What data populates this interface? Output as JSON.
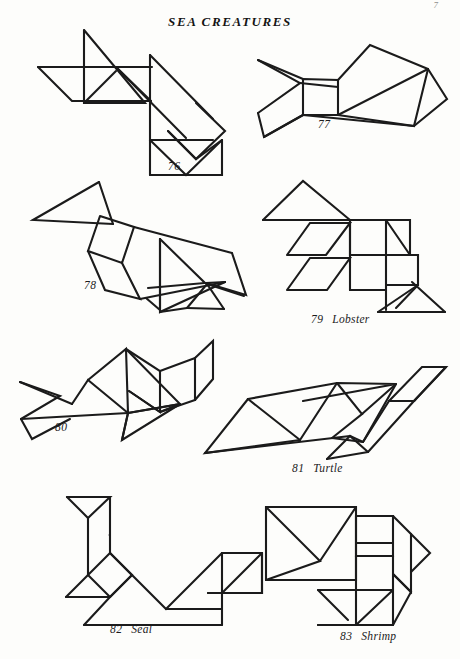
{
  "page": {
    "title": "SEA CREATURES",
    "corner_mark": "7",
    "background_color": "#fdfdfb",
    "ink_color": "#1b1b1b",
    "width": 460,
    "height": 659
  },
  "figures": [
    {
      "number": "76",
      "name": "",
      "caption_x": 168,
      "caption_y": 160,
      "description": "tangram sea creature 76"
    },
    {
      "number": "77",
      "name": "",
      "caption_x": 318,
      "caption_y": 118,
      "description": "tangram fish 77"
    },
    {
      "number": "78",
      "name": "",
      "caption_x": 84,
      "caption_y": 279,
      "description": "tangram sea creature 78"
    },
    {
      "number": "79",
      "name": "Lobster",
      "caption_x": 311,
      "caption_y": 313,
      "description": "tangram lobster"
    },
    {
      "number": "80",
      "name": "",
      "caption_x": 55,
      "caption_y": 421,
      "description": "tangram sea creature 80"
    },
    {
      "number": "81",
      "name": "Turtle",
      "caption_x": 292,
      "caption_y": 462,
      "description": "tangram turtle"
    },
    {
      "number": "82",
      "name": "Seal",
      "caption_x": 110,
      "caption_y": 623,
      "description": "tangram seal"
    },
    {
      "number": "83",
      "name": "Shrimp",
      "caption_x": 340,
      "caption_y": 630,
      "description": "tangram shrimp"
    }
  ],
  "shapes": {
    "fig76": [
      "84,30 84,103 145,103",
      "84,103 145,103 114,72",
      "38,68 152,68",
      "38,68 74,103 152,103 114,68",
      "152,68 152,103",
      "145,103 152,103",
      "38,68 38,68",
      "147,50 147,148 218,148 147,50",
      "147,148 218,148 230,122",
      "185,122 218,86 230,122 196,148",
      "124,148 196,148 160,113",
      "124,148 196,148 160,113 124,148"
    ],
    "fig77": [
      "256,62 296,82 256,114 264,132 302,112 302,76",
      "302,76 302,112 340,112 340,76 302,76",
      "340,76 340,112",
      "256,62 296,82 302,76",
      "296,82 340,82",
      "340,76 370,46 430,71 340,112",
      "340,112 430,71 416,127 340,112",
      "430,71 447,101 416,127",
      "264,132 302,112 340,112 416,127"
    ],
    "fig83": [
      "266,507 346,507 346,582 266,582",
      "266,507 346,582",
      "346,515 392,515 392,560 346,560",
      "346,515 346,560",
      "300,583 392,583 392,627 300,627",
      "392,560 424,588 392,617",
      "346,560 346,583"
    ]
  }
}
